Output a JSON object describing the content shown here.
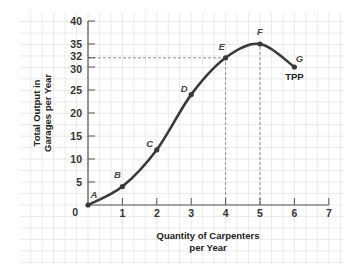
{
  "chart_data": {
    "type": "line",
    "title": "",
    "xlabel": "Quantity of Carpenters per Year",
    "xlabel_lines": [
      "Quantity of Carpenters",
      "per Year"
    ],
    "ylabel": "Total Output in Garages per Year",
    "ylabel_lines": [
      "Total Output in",
      "Garages per Year"
    ],
    "xlim": [
      0,
      7
    ],
    "ylim": [
      0,
      40
    ],
    "x_ticks": [
      0,
      1,
      2,
      3,
      4,
      5,
      6,
      7
    ],
    "y_ticks": [
      0,
      5,
      10,
      15,
      20,
      25,
      30,
      32,
      35,
      40
    ],
    "grid": true,
    "series": [
      {
        "name": "TPP",
        "points": [
          {
            "label": "A",
            "x": 0,
            "y": 0
          },
          {
            "label": "B",
            "x": 1,
            "y": 4
          },
          {
            "label": "C",
            "x": 2,
            "y": 12
          },
          {
            "label": "D",
            "x": 3,
            "y": 24
          },
          {
            "label": "E",
            "x": 4,
            "y": 32
          },
          {
            "label": "F",
            "x": 5,
            "y": 35
          },
          {
            "label": "G",
            "x": 6,
            "y": 30
          }
        ]
      }
    ],
    "annotations": [
      {
        "type": "dashed-guide",
        "from": {
          "x": 0,
          "y": 32
        },
        "to": {
          "x": 4,
          "y": 32
        }
      },
      {
        "type": "dashed-guide",
        "from": {
          "x": 4,
          "y": 0
        },
        "to": {
          "x": 4,
          "y": 32
        }
      },
      {
        "type": "dashed-guide",
        "from": {
          "x": 5,
          "y": 0
        },
        "to": {
          "x": 5,
          "y": 35
        }
      },
      {
        "type": "text",
        "text": "TPP",
        "near": "G"
      }
    ]
  },
  "colors": {
    "curve": "#3a3a3a",
    "axis": "#555555",
    "grid": "#e4e4e4",
    "guide": "#888888"
  }
}
